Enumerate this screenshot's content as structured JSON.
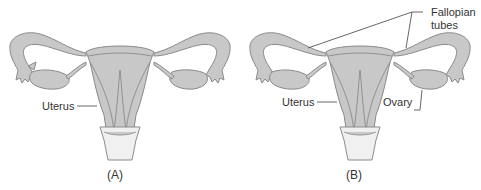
{
  "figure": {
    "panels": [
      {
        "id": "A",
        "caption": "(A)",
        "labels": {
          "uterus": "Uterus"
        }
      },
      {
        "id": "B",
        "caption": "(B)",
        "labels": {
          "uterus": "Uterus",
          "ovary": "Ovary",
          "fallopian_line1": "Fallopian",
          "fallopian_line2": "tubes"
        }
      }
    ],
    "colors": {
      "tissue_fill": "#c8c8c8",
      "outline": "#8a8a8a",
      "vagina_fill": "#f0f0f0",
      "text": "#333333",
      "leader_line": "#555555"
    }
  }
}
